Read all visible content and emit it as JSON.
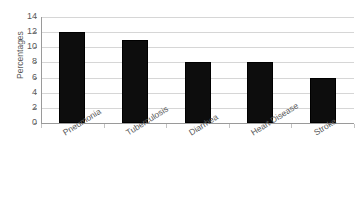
{
  "chart_data": {
    "type": "bar",
    "title": "",
    "subtitle": "",
    "xlabel": "",
    "ylabel": "Percentages",
    "categories": [
      "Pneumonia",
      "Tuberculosis",
      "Diarrhea",
      "Heart Disease",
      "Stroke"
    ],
    "values": [
      12,
      11,
      8,
      8,
      6
    ],
    "series": [
      {
        "name": "Percentages",
        "values": [
          12,
          11,
          8,
          8,
          6
        ]
      }
    ],
    "ylim": [
      0,
      14
    ],
    "ytick_values": [
      0,
      2,
      4,
      6,
      8,
      10,
      12,
      14
    ],
    "ytick_labels": [
      "0",
      "2",
      "4",
      "6",
      "8",
      "10",
      "12",
      "14"
    ],
    "grid": true,
    "grid_axis": "y",
    "legend": false,
    "legend_position": "none",
    "bar_color": "#0d0d0d",
    "grid_color": "#d6d6d6",
    "axis_color": "#9a9a9a",
    "text_color": "#5a5a5a",
    "background_color": "#ffffff",
    "xtick_label_rotation": -32
  }
}
